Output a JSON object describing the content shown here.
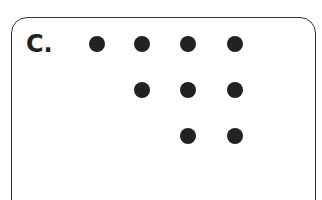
{
  "panel": {
    "label": "C.",
    "dot_color": "#222222",
    "rows": [
      {
        "y": 44,
        "xs": [
          97,
          142,
          188,
          235
        ]
      },
      {
        "y": 90,
        "xs": [
          142,
          188,
          235
        ]
      },
      {
        "y": 136,
        "xs": [
          188,
          235
        ]
      }
    ],
    "dot_count": 9
  }
}
